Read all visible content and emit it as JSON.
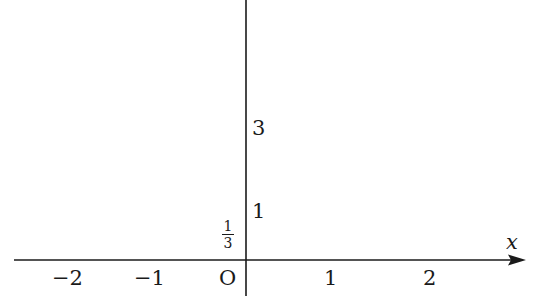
{
  "diagram": {
    "type": "coordinate-axes",
    "x_axis": {
      "label": "x",
      "ticks": [
        "−2",
        "−1",
        "1",
        "2"
      ]
    },
    "origin_label": "O",
    "y_axis": {
      "ticks": [
        "3",
        "1"
      ],
      "fraction": {
        "numerator": "1",
        "denominator": "3"
      }
    }
  }
}
